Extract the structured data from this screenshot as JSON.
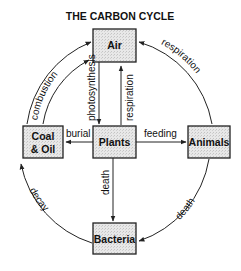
{
  "title": "THE CARBON CYCLE",
  "colors": {
    "box_fill": "#e6e6e6",
    "stroke": "#222222",
    "text": "#111111",
    "background": "#ffffff"
  },
  "nodes": {
    "air": {
      "label": "Air"
    },
    "plants": {
      "label": "Plants"
    },
    "coal_oil": {
      "label_line1": "Coal",
      "label_line2": "& Oil"
    },
    "animals": {
      "label": "Animals"
    },
    "bacteria": {
      "label": "Bacteria"
    }
  },
  "edges": {
    "photosynthesis": {
      "label": "photosynthesis",
      "from": "Air",
      "to": "Plants"
    },
    "plant_respiration": {
      "label": "respiration",
      "from": "Plants",
      "to": "Air"
    },
    "burial": {
      "label": "burial",
      "from": "Plants",
      "to": "Coal & Oil"
    },
    "feeding": {
      "label": "feeding",
      "from": "Plants",
      "to": "Animals"
    },
    "plant_death": {
      "label": "death",
      "from": "Plants",
      "to": "Bacteria"
    },
    "combustion": {
      "label": "combustion",
      "from": "Coal & Oil",
      "to": "Air"
    },
    "animal_respiration": {
      "label": "respiration",
      "from": "Animals",
      "to": "Air"
    },
    "animal_death": {
      "label": "death",
      "from": "Animals",
      "to": "Bacteria"
    },
    "decay": {
      "label": "decay",
      "from": "Bacteria",
      "to": "Coal & Oil"
    }
  }
}
